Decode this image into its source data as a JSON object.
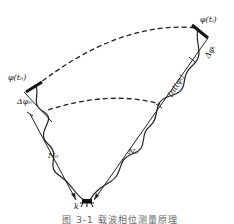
{
  "diagram": {
    "labels": {
      "phi_t0": "φ(t₀)",
      "delta_phi0": "Δφ₀",
      "phi_ti": "φ(tᵢ)",
      "delta_phii": "Δφᵢ",
      "int_phii": "Int(φᵢ)",
      "N0_left": "N₀",
      "N0_right": "N₀",
      "receiver": "k"
    },
    "caption": "图 3-1   载波相位测量原理"
  }
}
